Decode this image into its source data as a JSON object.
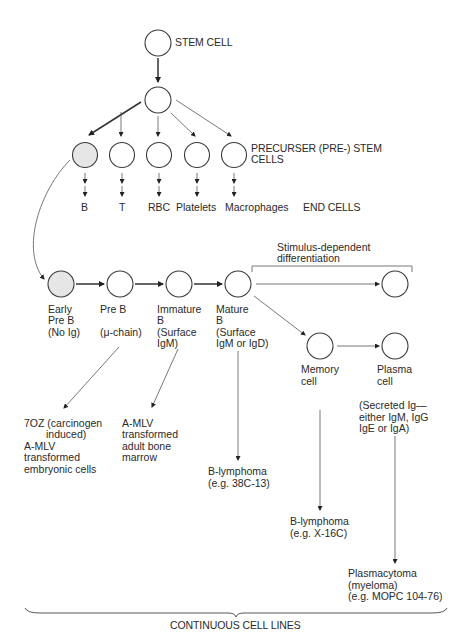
{
  "diagram": {
    "top": {
      "stem_cell_label": "STEM CELL",
      "precursor_label_line1": "PRECURSER (PRE-) STEM",
      "precursor_label_line2": "CELLS",
      "end_cells_label": "END CELLS",
      "end_cells": [
        {
          "label": "B"
        },
        {
          "label": "T"
        },
        {
          "label": "RBC"
        },
        {
          "label": "Platelets"
        },
        {
          "label": "Macrophages"
        }
      ]
    },
    "lineage": {
      "stages": [
        {
          "line1": "Early",
          "line2": "Pre B",
          "line3": "(No Ig)"
        },
        {
          "line1": "Pre B",
          "line2": "",
          "line3": "(μ-chain)"
        },
        {
          "line1": "Immature",
          "line2": "B",
          "line3": "(Surface",
          "line4": "IgM)"
        },
        {
          "line1": "Mature",
          "line2": "B",
          "line3": "(Surface",
          "line4": "IgM or IgD)"
        }
      ],
      "stimulus_label_line1": "Stimulus-dependent",
      "stimulus_label_line2": "differentiation",
      "memory_cell_line1": "Memory",
      "memory_cell_line2": "cell",
      "plasma_cell_line1": "Plasma",
      "plasma_cell_line2": "cell",
      "secreted_line1": "(Secreted Ig—",
      "secreted_line2": "either IgM, IgG",
      "secreted_line3": "IgE or IgA)"
    },
    "cell_lines": {
      "oz_line1": "7OZ (carcinogen",
      "oz_line2": "induced)",
      "oz_line3": "A-MLV",
      "oz_line4": "transformed",
      "oz_line5": "embryonic cells",
      "amlv_line1": "A-MLV",
      "amlv_line2": "transformed",
      "amlv_line3": "adult bone",
      "amlv_line4": "marrow",
      "blymph1_line1": "B-lymphoma",
      "blymph1_line2": "(e.g. 38C-13)",
      "blymph2_line1": "B-lymphoma",
      "blymph2_line2": "(e.g. X-16C)",
      "plasmacytoma_line1": "Plasmacytoma",
      "plasmacytoma_line2": "(myeloma)",
      "plasmacytoma_line3": "(e.g. MOPC 104-76)",
      "bottom_label": "CONTINUOUS CELL LINES"
    },
    "colors": {
      "shaded_cell": "#e6e6e6",
      "line": "#3a3a3a"
    }
  }
}
